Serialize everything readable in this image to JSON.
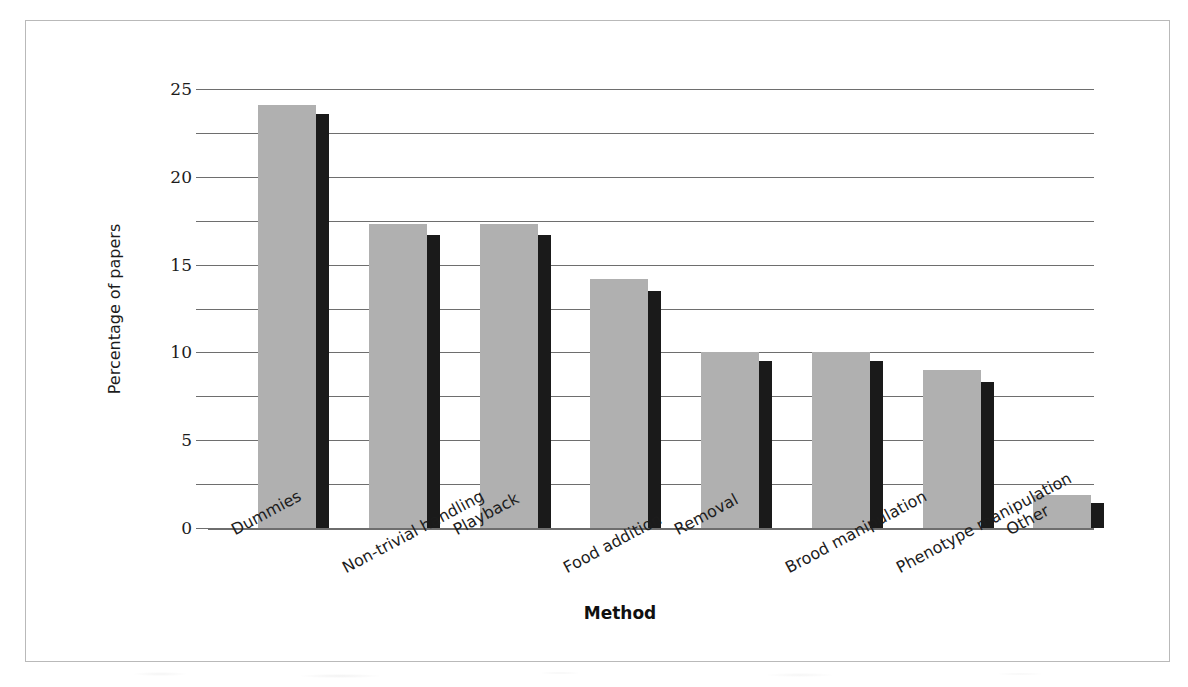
{
  "chart_data": {
    "type": "bar",
    "title": "",
    "xlabel": "Method",
    "ylabel": "Percentage of papers",
    "categories": [
      "Dummies",
      "Non-trivial handling",
      "Playback",
      "Food addition",
      "Removal",
      "Brood manipulation",
      "Phenotype manipulation",
      "Other"
    ],
    "series": [
      {
        "name": "gray-series",
        "color": "#b0b0b0",
        "values": [
          24.1,
          17.3,
          17.3,
          14.2,
          10.0,
          10.0,
          9.0,
          1.9
        ]
      },
      {
        "name": "black-series",
        "color": "#1a1a1a",
        "values": [
          23.6,
          16.7,
          16.7,
          13.5,
          9.5,
          9.5,
          8.3,
          1.4
        ]
      }
    ],
    "ylim": [
      0,
      25
    ],
    "ytick_labels": [
      "0",
      "5",
      "10",
      "15",
      "20",
      "25"
    ],
    "ytick_values": [
      0,
      5,
      10,
      15,
      20,
      25
    ],
    "minor_gridline_values": [
      2.5,
      7.5,
      12.5,
      17.5,
      22.5
    ],
    "grid": true,
    "legend": "none"
  }
}
